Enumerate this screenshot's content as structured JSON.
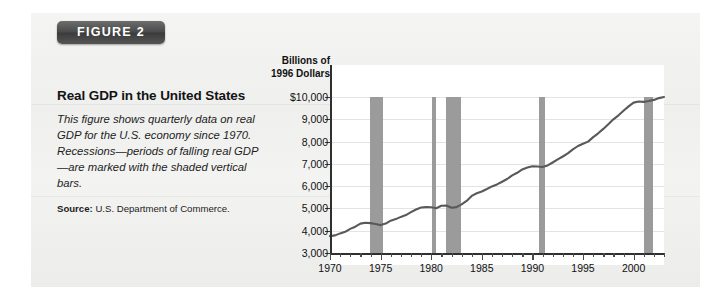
{
  "figure": {
    "badge_label": "FIGURE 2",
    "title": "Real GDP in the United States",
    "description": "This figure shows quarterly data on real GDP for the U.S. economy since 1970. Recessions—periods of falling real GDP—are marked with the shaded vertical bars.",
    "source_label": "Source:",
    "source_text": "U.S. Department of Commerce."
  },
  "chart_data": {
    "type": "line",
    "title": "Real GDP in the United States",
    "ylabel_line1": "Billions of",
    "ylabel_line2": "1996 Dollars",
    "xlabel": "",
    "grid": true,
    "legend": "none",
    "xlim": [
      1970,
      2003
    ],
    "ylim": [
      3000,
      10000
    ],
    "ytick_labels": [
      "$10,000",
      "9,000",
      "8,000",
      "7,000",
      "6,000",
      "5,000",
      "4,000",
      "3,000"
    ],
    "ytick_values": [
      10000,
      9000,
      8000,
      7000,
      6000,
      5000,
      4000,
      3000
    ],
    "xtick_labels": [
      "1970",
      "1975",
      "1980",
      "1985",
      "1990",
      "1995",
      "2000"
    ],
    "xtick_values": [
      1970,
      1975,
      1980,
      1985,
      1990,
      1995,
      2000
    ],
    "series": [
      {
        "name": "Real GDP",
        "color": "#595959",
        "x": [
          1970,
          1970.5,
          1971,
          1971.5,
          1972,
          1972.5,
          1973,
          1973.5,
          1974,
          1974.5,
          1975,
          1975.5,
          1976,
          1976.5,
          1977,
          1977.5,
          1978,
          1978.5,
          1979,
          1979.5,
          1980,
          1980.5,
          1981,
          1981.5,
          1982,
          1982.5,
          1983,
          1983.5,
          1984,
          1984.5,
          1985,
          1985.5,
          1986,
          1986.5,
          1987,
          1987.5,
          1988,
          1988.5,
          1989,
          1989.5,
          1990,
          1990.5,
          1991,
          1991.5,
          1992,
          1992.5,
          1993,
          1993.5,
          1994,
          1994.5,
          1995,
          1995.5,
          1996,
          1996.5,
          1997,
          1997.5,
          1998,
          1998.5,
          1999,
          1999.5,
          2000,
          2000.5,
          2001,
          2001.5,
          2002,
          2002.5,
          2003
        ],
        "y": [
          3760,
          3790,
          3880,
          3950,
          4080,
          4180,
          4320,
          4360,
          4340,
          4300,
          4250,
          4320,
          4450,
          4520,
          4620,
          4700,
          4830,
          4950,
          5040,
          5060,
          5050,
          5010,
          5120,
          5130,
          5030,
          5060,
          5180,
          5340,
          5560,
          5680,
          5760,
          5870,
          5990,
          6080,
          6200,
          6320,
          6480,
          6600,
          6750,
          6830,
          6890,
          6880,
          6860,
          6930,
          7060,
          7200,
          7330,
          7470,
          7650,
          7800,
          7900,
          8000,
          8200,
          8370,
          8570,
          8780,
          9000,
          9180,
          9380,
          9580,
          9750,
          9800,
          9780,
          9820,
          9870,
          9950,
          10000
        ],
        "unit": "Billions of 1996 Dollars"
      }
    ],
    "recession_bars": [
      {
        "start": 1973.9,
        "end": 1975.2,
        "label": "1973-75 recession"
      },
      {
        "start": 1980.1,
        "end": 1980.5,
        "label": "1980 recession"
      },
      {
        "start": 1981.5,
        "end": 1982.9,
        "label": "1981-82 recession"
      },
      {
        "start": 1990.6,
        "end": 1991.2,
        "label": "1990-91 recession"
      },
      {
        "start": 2001.0,
        "end": 2001.9,
        "label": "2001 recession"
      }
    ],
    "bar_color": "#9b9b9b",
    "line_color": "#595959"
  }
}
